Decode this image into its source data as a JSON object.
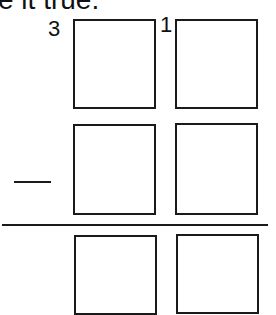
{
  "prompt": {
    "text": "e it true."
  },
  "problem": {
    "operation": "subtraction",
    "operator_symbol": "minus",
    "carry_marks": [
      "3",
      "1"
    ],
    "rows": [
      {
        "name": "minuend",
        "boxes": [
          "",
          ""
        ]
      },
      {
        "name": "subtrahend",
        "boxes": [
          "",
          ""
        ]
      },
      {
        "name": "difference",
        "boxes": [
          "",
          ""
        ]
      }
    ]
  }
}
